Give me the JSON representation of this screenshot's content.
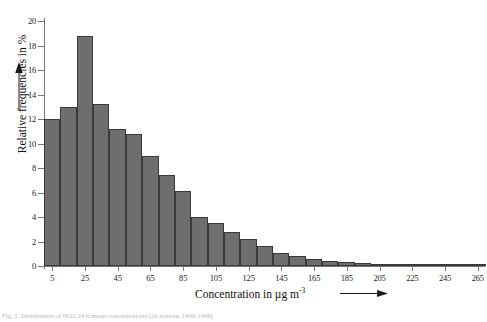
{
  "figure": {
    "caption": "Fig. 1. Distribution of NO2 24 h mean concentrations (all stations 1990-1998)"
  },
  "chart_data": {
    "type": "bar",
    "title": "",
    "xlabel": "Concentration in µg m",
    "xlabel_exponent": "-3",
    "ylabel": "Relative frequencies in %",
    "xlim": [
      0,
      270
    ],
    "ylim": [
      0,
      20
    ],
    "ytick_step": 2,
    "bin_width": 10,
    "grid": false,
    "legend": false,
    "x_arrow": true,
    "y_arrow": true,
    "yticks": [
      "0",
      "2",
      "4",
      "6",
      "8",
      "10",
      "12",
      "14",
      "16",
      "18",
      "20"
    ],
    "xticks": [
      "5",
      "25",
      "45",
      "65",
      "85",
      "105",
      "125",
      "145",
      "165",
      "185",
      "205",
      "225",
      "245",
      "265"
    ],
    "bin_centers": [
      5,
      15,
      25,
      35,
      45,
      55,
      65,
      75,
      85,
      95,
      105,
      115,
      125,
      135,
      145,
      155,
      165,
      175,
      185,
      195,
      205,
      215,
      225,
      235,
      245,
      255,
      265
    ],
    "values": [
      12.0,
      13.0,
      18.8,
      13.2,
      11.2,
      10.8,
      9.0,
      7.4,
      6.1,
      4.0,
      3.5,
      2.8,
      2.2,
      1.6,
      1.1,
      0.8,
      0.6,
      0.45,
      0.3,
      0.25,
      0.2,
      0.15,
      0.1,
      0.1,
      0.05,
      0.05,
      0.05
    ],
    "bar_color": "#6e6e6e",
    "bar_edge_color": "#3a3a3a",
    "axis_color": "#767676"
  }
}
